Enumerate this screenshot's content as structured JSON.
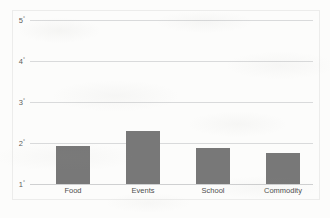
{
  "chart_data": {
    "type": "bar",
    "title": "",
    "subtitle": "",
    "xlabel": "",
    "ylabel": "",
    "categories": [
      "Food",
      "Events",
      "School",
      "Commodity"
    ],
    "values": [
      1.93,
      2.29,
      1.88,
      1.76
    ],
    "series": [
      {
        "name": "",
        "values": [
          1.93,
          2.29,
          1.88,
          1.76
        ]
      }
    ],
    "ylim": [
      1,
      5
    ],
    "yticks": [
      1,
      2,
      3,
      4,
      5
    ],
    "ytick_labels": [
      "1",
      "2",
      "3",
      "4",
      "5"
    ],
    "ytick_suffix": "°",
    "grid": true,
    "grid_axis": "y",
    "legend": false,
    "legend_position": "none",
    "bar_color": "#787878",
    "gridline_color": "#d9dadb",
    "plot_border_color": "#ececeb",
    "background_color": "#fcfcfb",
    "annotations": []
  },
  "axes": {
    "y": {
      "ticks": [
        {
          "value": 5,
          "label": "5",
          "suffix": "°"
        },
        {
          "value": 4,
          "label": "4",
          "suffix": "°"
        },
        {
          "value": 3,
          "label": "3",
          "suffix": "°"
        },
        {
          "value": 2,
          "label": "2",
          "suffix": "°"
        },
        {
          "value": 1,
          "label": "1",
          "suffix": "°"
        }
      ]
    },
    "x": {
      "ticks": [
        {
          "label": "Food"
        },
        {
          "label": "Events"
        },
        {
          "label": "School"
        },
        {
          "label": "Commodity"
        }
      ]
    }
  }
}
